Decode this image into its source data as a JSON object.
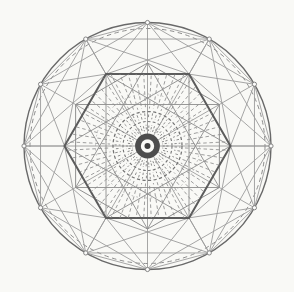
{
  "meta": {
    "width": 294,
    "height": 292,
    "background": "#f9f9f6"
  },
  "figure": {
    "center": {
      "x": 147.5,
      "y": 146
    },
    "outer_vertex_count": 12,
    "outer_start_angle": -90,
    "hexagon_radius": 83,
    "colors": {
      "dark_line": "#5c5c5c",
      "mid_line": "#8c8c8c",
      "light_line": "#9c9c9c",
      "bullseye": "#4d4d4d",
      "paper": "#f9f9f6"
    },
    "layers": [
      {
        "type": "circle",
        "name": "outer-circle",
        "r": 123.5,
        "color": "#696969",
        "width": 1.4
      },
      {
        "type": "circle",
        "name": "boundary-dashed-circle",
        "r": 117.5,
        "color": "#8d8d8d",
        "width": 1.0,
        "dash": "4.5,3.5"
      },
      {
        "type": "ngon",
        "name": "dodecagon-outline",
        "n": 12,
        "r": 123.5,
        "start": -90,
        "color": "#9c9c9c",
        "width": 0.9
      },
      {
        "type": "starpoly",
        "name": "skip-two-chords",
        "n": 12,
        "r": 123.5,
        "start": -90,
        "skip": 2,
        "color": "#9c9c9c",
        "width": 0.9
      },
      {
        "type": "diameters",
        "name": "diameter-lines",
        "n": 12,
        "r": 123.5,
        "start": -90,
        "color": "#919191",
        "width": 0.8
      },
      {
        "type": "outer-hex-chords",
        "name": "vertex-to-hexagon-chords",
        "rOuter": 123.5,
        "outerStart": -90,
        "rHex": 83,
        "hexStart": 0,
        "maxAngleDiff": 61,
        "color": "#9c9c9c",
        "width": 0.9
      },
      {
        "type": "starpoly",
        "name": "hexagram-primary",
        "n": 6,
        "r": 83,
        "start": 0,
        "skip": 2,
        "color": "#8c8c8c",
        "width": 0.9
      },
      {
        "type": "starpoly",
        "name": "hexagram-secondary",
        "n": 6,
        "r": 83,
        "start": 30,
        "skip": 2,
        "color": "#8c8c8c",
        "width": 0.9
      },
      {
        "type": "ngon",
        "name": "hexagon-secondary",
        "n": 6,
        "r": 83,
        "start": 30,
        "color": "#8f8f8f",
        "width": 1.0
      },
      {
        "type": "ngon",
        "name": "hexagon-primary",
        "n": 6,
        "r": 83,
        "start": 0,
        "color": "#5c5c5c",
        "width": 2.0
      },
      {
        "type": "radial-field",
        "name": "radial-hatch-field",
        "n": 60,
        "r0": 37.5,
        "r1": 82,
        "angleOffset": 3,
        "clipHex": true,
        "color": "#8e8e8e",
        "width": 0.85,
        "dash": "3.5,2.7"
      },
      {
        "type": "circle",
        "name": "hatch-boundary-faint",
        "r": 52,
        "color": "#a8a8a8",
        "width": 0.8,
        "dash": "1.6,3.2"
      },
      {
        "type": "tick-ring",
        "name": "outer-tick-ring",
        "n": 52,
        "r0": 27,
        "r1": 33,
        "angleOffset": 2,
        "color": "#828282",
        "width": 0.9,
        "dash": "2.6,2"
      },
      {
        "type": "circle",
        "name": "dashed-ring-outer",
        "r": 34.5,
        "color": "#747474",
        "width": 1.25,
        "dash": "3.2,2.4"
      },
      {
        "type": "circle",
        "name": "dashed-ring-inner",
        "r": 24.5,
        "color": "#777777",
        "width": 1.1,
        "dash": "2.8,2.2"
      },
      {
        "type": "tick-ring",
        "name": "inner-tick-ring",
        "n": 46,
        "r0": 15,
        "r1": 21.3,
        "angleOffset": 0,
        "color": "#7c7c7c",
        "width": 0.9,
        "dash": "2.2,1.6"
      },
      {
        "type": "bullseye",
        "name": "center-bullseye",
        "discR": 6.7,
        "ringR": 9.55,
        "ringWidth": 5.7,
        "ringColor": "#4d4d4d",
        "dotR": 3,
        "dotColor": "#3f3f3f",
        "discColor": "#f9f9f6"
      },
      {
        "type": "markers",
        "name": "vertex-markers",
        "n": 12,
        "r": 123.5,
        "start": -90,
        "markerR": 2.1,
        "fill": "#fbfbfa",
        "color": "#7a7a7a",
        "width": 0.9
      }
    ]
  }
}
